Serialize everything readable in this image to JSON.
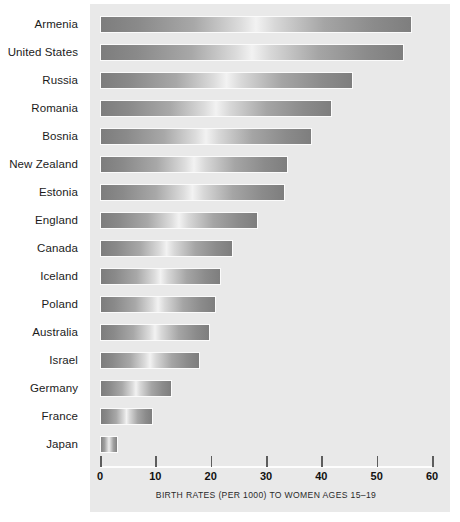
{
  "chart_data": {
    "type": "bar",
    "orientation": "horizontal",
    "title": "",
    "xlabel": "BIRTH RATES (PER 1000) TO WOMEN AGES 15–19",
    "ylabel": "",
    "xlim": [
      0,
      60
    ],
    "xticks": [
      0,
      10,
      20,
      30,
      40,
      50,
      60
    ],
    "xtick_labels": [
      "0",
      "10",
      "20",
      "30",
      "40",
      "50",
      "60"
    ],
    "grid": false,
    "legend": null,
    "categories": [
      "Armenia",
      "United States",
      "Russia",
      "Romania",
      "Bosnia",
      "New Zealand",
      "Estonia",
      "England",
      "Canada",
      "Iceland",
      "Poland",
      "Australia",
      "Israel",
      "Germany",
      "France",
      "Japan"
    ],
    "values": [
      56.4,
      55.0,
      45.8,
      42.0,
      38.3,
      34.0,
      33.4,
      28.6,
      24.0,
      21.9,
      21.0,
      19.9,
      18.0,
      13.0,
      9.6,
      3.3
    ]
  },
  "colors": {
    "panel_background": "#e9e9e9",
    "bar_dark": "#7d7d7d",
    "bar_highlight": "#f2f2f2",
    "bar_border": "#fbfbfb",
    "axis_line": "#fdfdfd",
    "tick": "#5d5d5d",
    "label_text": "#1b1b1b",
    "page_background": "#ffffff"
  }
}
